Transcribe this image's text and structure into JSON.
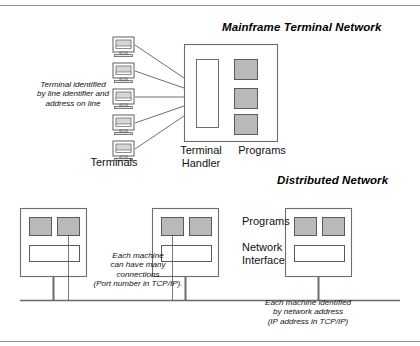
{
  "figure": {
    "title_mainframe": "Mainframe Terminal Network",
    "title_distributed": "Distributed Network"
  },
  "mainframe": {
    "terminals_count": 5,
    "terminal_icon": "terminal-monitor-icon",
    "note_terminal_identified": "Terminal identified\nby line identifier and\naddress on line",
    "label_terminals": "Terminals",
    "label_terminal_handler": "Terminal\nHandler",
    "label_programs": "Programs",
    "programs_count": 3,
    "handler_box": "terminal-handler-box"
  },
  "distributed": {
    "machines_count": 3,
    "programs_per_machine": 2,
    "label_programs": "Programs",
    "label_network_interface": "Network\nInterface",
    "note_connections": "Each machine\ncan have many\nconnections\n(Port number in TCP/IP).",
    "note_address": "Each machine identified\nby network address\n(IP address in TCP/IP)"
  },
  "colors": {
    "program_fill": "#b9b9b9",
    "program_stroke": "#5a5a5a",
    "box_stroke": "#6e6e6e",
    "line": "#5f5f5f",
    "bus": "#6a6a6a",
    "rule": "#8c8c8c",
    "white": "#ffffff",
    "text": "#111111"
  }
}
